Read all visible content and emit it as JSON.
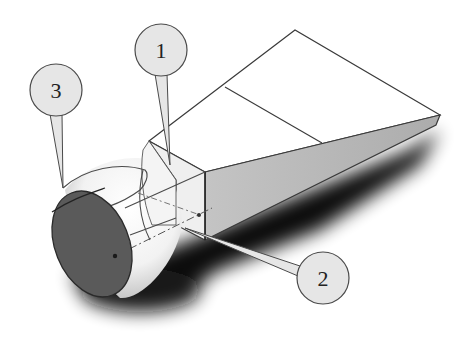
{
  "diagram": {
    "type": "3d-cad-model",
    "colors": {
      "background": "#ffffff",
      "edge": "#3a3a3a",
      "circle_face": "#5a5a5a",
      "wedge_side": "#b8b8b8",
      "wedge_top": "#ffffff",
      "shadow": "#000000",
      "callout_fill": "#e6e6e6",
      "callout_stroke": "#4a4a4a"
    },
    "callouts": [
      {
        "id": "1",
        "label": "1",
        "cx": 161,
        "cy": 50,
        "r": 26,
        "target": [
          170,
          165
        ],
        "points_to": "square neck section"
      },
      {
        "id": "2",
        "label": "2",
        "cx": 323,
        "cy": 278,
        "r": 26,
        "target": [
          185,
          228
        ],
        "points_to": "loft guide/axis line"
      },
      {
        "id": "3",
        "label": "3",
        "cx": 56,
        "cy": 90,
        "r": 26,
        "target": [
          63,
          188
        ],
        "points_to": "circular end face"
      }
    ]
  }
}
